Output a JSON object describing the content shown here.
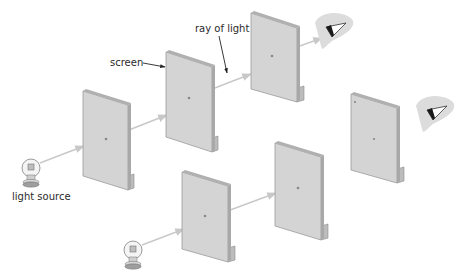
{
  "diagram": {
    "labels": {
      "screen": "screen",
      "ray": "ray of light",
      "source": "light source"
    },
    "colors": {
      "screen_face": "#d4d4d4",
      "screen_edge": "#9a9a9a",
      "ray": "#c8c8c8",
      "arrow_line": "#222222",
      "skin": "#dcdcdc",
      "eye_dark": "#1a1a1a"
    },
    "setups": [
      {
        "name": "aligned-holes",
        "description": "Holes in line: light reaches eye",
        "screens": 3,
        "light_reaches_eye": true
      },
      {
        "name": "misaligned-holes",
        "description": "Holes not in line: light blocked",
        "screens": 3,
        "light_reaches_eye": false
      }
    ]
  }
}
